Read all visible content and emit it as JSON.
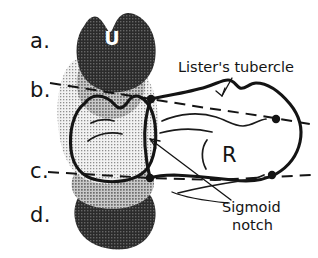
{
  "figure": {
    "background_color": "#ffffff",
    "ink_color": "#141414"
  },
  "section_labels": [
    {
      "id": "a",
      "text": "a.",
      "x": 30,
      "y": 48
    },
    {
      "id": "b",
      "text": "b.",
      "x": 30,
      "y": 97
    },
    {
      "id": "c",
      "text": "c.",
      "x": 30,
      "y": 178
    },
    {
      "id": "d",
      "text": "d.",
      "x": 30,
      "y": 222
    }
  ],
  "bone_labels": [
    {
      "id": "ulna",
      "text": "U",
      "x": 112,
      "y": 45,
      "color": "#ffffff"
    },
    {
      "id": "radius",
      "text": "R",
      "x": 222,
      "y": 158,
      "color": "#141414"
    }
  ],
  "annotations": [
    {
      "id": "listers-tubercle",
      "text": "Lister's tubercle",
      "lines": [
        "Lister's tubercle"
      ],
      "x": 178,
      "y": 72
    },
    {
      "id": "sigmoid-notch",
      "text": "Sigmoid notch",
      "lines": [
        "Sigmoid",
        "notch"
      ],
      "x": 222,
      "y": 212
    }
  ],
  "axis_lines": [
    {
      "id": "level-b",
      "label": "b.",
      "style": "dashed"
    },
    {
      "id": "level-c",
      "label": "c.",
      "style": "dashed"
    }
  ],
  "shading": {
    "ulna_dark": "#3a3a3a",
    "ulna_mid": "#a6a6a6",
    "ulna_light": "#d4d4d4",
    "radius_fill": "#ffffff"
  }
}
